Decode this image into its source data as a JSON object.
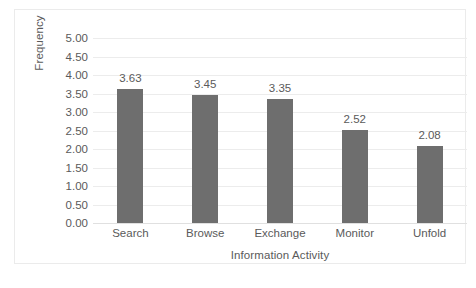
{
  "chart_data": {
    "type": "bar",
    "title": "",
    "categories": [
      "Search",
      "Browse",
      "Exchange",
      "Monitor",
      "Unfold"
    ],
    "values": [
      3.63,
      3.45,
      3.35,
      2.52,
      2.08
    ],
    "data_labels": [
      "3.63",
      "3.45",
      "3.35",
      "2.52",
      "2.08"
    ],
    "xlabel": "Information Activity",
    "ylabel": "Frequency",
    "ylim": [
      0.0,
      5.0
    ],
    "ytick_step": 0.5,
    "ytick_labels": [
      "5.00",
      "4.50",
      "4.00",
      "3.50",
      "3.00",
      "2.50",
      "2.00",
      "1.50",
      "1.00",
      "0.50",
      "0.00"
    ],
    "ytick_values": [
      5.0,
      4.5,
      4.0,
      3.5,
      3.0,
      2.5,
      2.0,
      1.5,
      1.0,
      0.5,
      0.0
    ],
    "grid": "horizontal",
    "legend": "none",
    "series": [
      {
        "name": "Frequency",
        "values": [
          3.63,
          3.45,
          3.35,
          2.52,
          2.08
        ]
      }
    ],
    "colors": {
      "bar_fill": "#6e6e6e",
      "gridline": "#ececec",
      "text": "#5a5a5a",
      "frame_border": "#ebebeb",
      "background": "#ffffff"
    }
  }
}
